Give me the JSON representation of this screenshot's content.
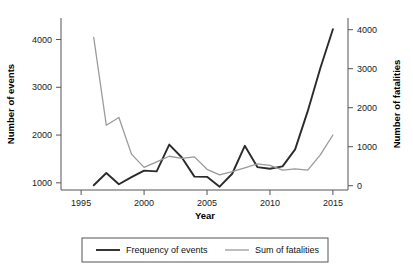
{
  "chart_data": {
    "type": "line",
    "title": "",
    "xlabel": "Year",
    "ylabel": "Number of events",
    "y2label": "Number of fatalities",
    "xlim": [
      1993.4,
      2016.2
    ],
    "ylim": [
      850,
      4450
    ],
    "y2lim": [
      -110,
      4300
    ],
    "grid": false,
    "legend_position": "bottom-center",
    "xticks": [
      1995,
      2000,
      2005,
      2010,
      2015
    ],
    "xtick_labels": [
      "1995",
      "2000",
      "2005",
      "2010",
      "2015"
    ],
    "yticks": [
      1000,
      2000,
      3000,
      4000
    ],
    "ytick_labels": [
      "1000",
      "2000",
      "3000",
      "4000"
    ],
    "y2ticks": [
      0,
      1000,
      2000,
      3000,
      4000
    ],
    "y2tick_labels": [
      "0",
      "1000",
      "2000",
      "3000",
      "4000"
    ],
    "x": [
      1996,
      1997,
      1998,
      1999,
      2000,
      2001,
      2002,
      2003,
      2004,
      2005,
      2006,
      2007,
      2008,
      2009,
      2010,
      2011,
      2012,
      2013,
      2014,
      2015
    ],
    "series": [
      {
        "name": "Frequency of events",
        "axis": "left",
        "color": "#2b2b2b",
        "width": 1.9,
        "values": [
          950,
          1205,
          970,
          1120,
          1255,
          1240,
          1800,
          1530,
          1130,
          1125,
          920,
          1190,
          1775,
          1330,
          1295,
          1345,
          1700,
          2500,
          3400,
          4215
        ]
      },
      {
        "name": "Sum of fatalities",
        "axis": "right",
        "color": "#9a9a9a",
        "width": 1.3,
        "values": [
          3800,
          1550,
          1750,
          810,
          470,
          610,
          755,
          700,
          740,
          420,
          280,
          360,
          460,
          560,
          520,
          400,
          430,
          400,
          790,
          1300
        ]
      }
    ]
  },
  "legend": {
    "entries": [
      {
        "label": "Frequency of events",
        "color": "#2b2b2b"
      },
      {
        "label": "Sum of fatalities",
        "color": "#9a9a9a"
      }
    ]
  }
}
